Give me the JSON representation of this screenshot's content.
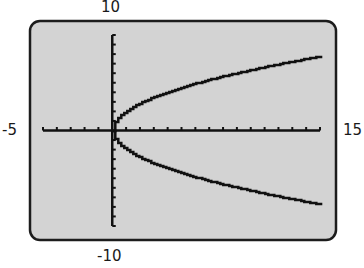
{
  "chart_data": {
    "type": "line",
    "title": "",
    "xlabel": "",
    "ylabel": "",
    "xlim": [
      -5,
      15
    ],
    "ylim": [
      -10,
      10
    ],
    "xscale_ticks": 1,
    "yscale_ticks": 1,
    "grid": false,
    "legend": null,
    "window_labels": {
      "xmin": "-5",
      "xmax": "15",
      "ymin": "-10",
      "ymax": "10"
    },
    "relation": "y^2 = 4x  (x = y^2/4)",
    "series": [
      {
        "name": "upper branch y = 2*sqrt(x)",
        "x": [
          0,
          1,
          2,
          3,
          4,
          5,
          6,
          7,
          8,
          9,
          10,
          11,
          12,
          13,
          14,
          15
        ],
        "y": [
          0,
          2.0,
          2.83,
          3.46,
          4.0,
          4.47,
          4.9,
          5.29,
          5.66,
          6.0,
          6.32,
          6.63,
          6.93,
          7.21,
          7.48,
          7.75
        ]
      },
      {
        "name": "lower branch y = -2*sqrt(x)",
        "x": [
          0,
          1,
          2,
          3,
          4,
          5,
          6,
          7,
          8,
          9,
          10,
          11,
          12,
          13,
          14,
          15
        ],
        "y": [
          0,
          -2.0,
          -2.83,
          -3.46,
          -4.0,
          -4.47,
          -4.9,
          -5.29,
          -5.66,
          -6.0,
          -6.32,
          -6.63,
          -6.93,
          -7.21,
          -7.48,
          -7.75
        ]
      }
    ]
  },
  "screen": {
    "background": "#d3d3d3",
    "border_color": "#1c1c1c",
    "curve_color": "#111111",
    "axis_color": "#111111"
  }
}
